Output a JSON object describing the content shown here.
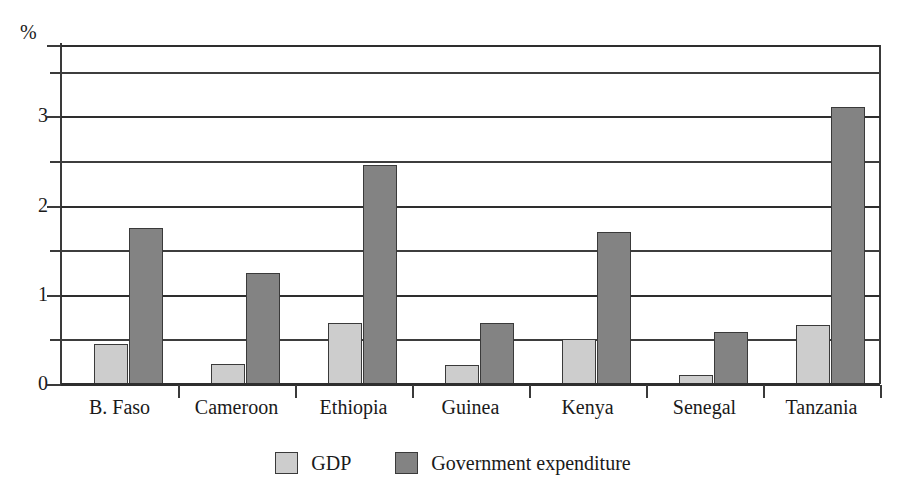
{
  "chart_data": {
    "type": "bar",
    "title": "",
    "subtitle": "",
    "xlabel": "",
    "ylabel": "%",
    "unit_label": "%",
    "categories": [
      "B. Faso",
      "Cameroon",
      "Ethiopia",
      "Guinea",
      "Kenya",
      "Senegal",
      "Tanzania"
    ],
    "series": [
      {
        "name": "GDP",
        "color": "#cdcdcd",
        "values": [
          0.45,
          0.22,
          0.68,
          0.21,
          0.5,
          0.1,
          0.66
        ]
      },
      {
        "name": "Government expenditure",
        "color": "#838383",
        "values": [
          1.75,
          1.25,
          2.45,
          0.68,
          1.7,
          0.58,
          3.1
        ]
      }
    ],
    "ylim": [
      0,
      3.8
    ],
    "ytick_labels": [
      "0",
      "1",
      "2",
      "3"
    ],
    "ytick_values": [
      0,
      1,
      2,
      3
    ],
    "minor_gridline_values": [
      0.5,
      1.5,
      2.5,
      3.5
    ],
    "grid": "horizontal",
    "legend_position": "bottom"
  },
  "legend": {
    "items": [
      {
        "label": "GDP",
        "swatch": "light-gray-swatch"
      },
      {
        "label": "Government expenditure",
        "swatch": "dark-gray-swatch"
      }
    ]
  },
  "axis": {
    "unit": "%",
    "ticks": [
      {
        "label": "0"
      },
      {
        "label": "1"
      },
      {
        "label": "2"
      },
      {
        "label": "3"
      }
    ]
  },
  "colors": {
    "gdp_fill": "#cdcdcd",
    "government_fill": "#838383",
    "axis_stroke": "#3a3a3a",
    "background": "#ffffff"
  }
}
